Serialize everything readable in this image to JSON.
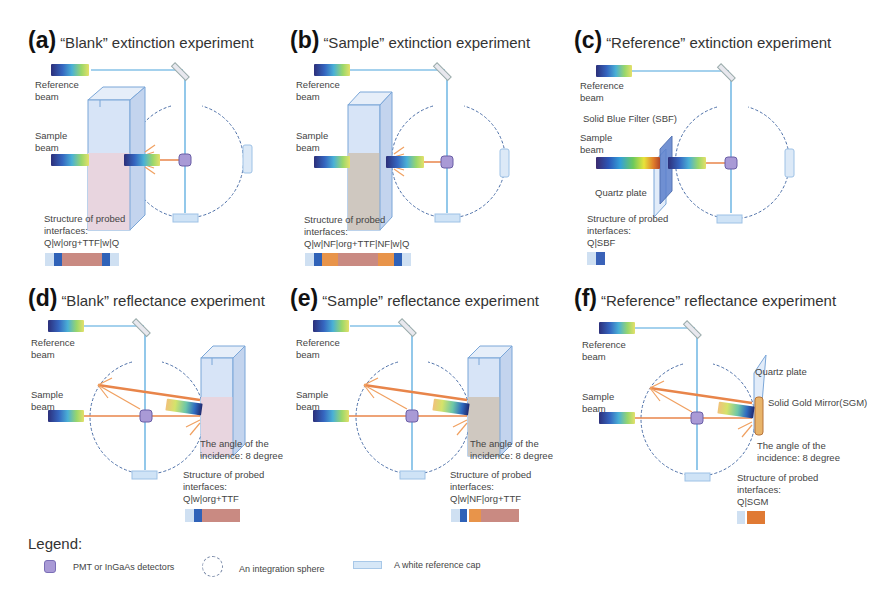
{
  "colors": {
    "beam_line": "#4aa3dc",
    "orange_ray": "#f0a060",
    "detector": "#a99ad6",
    "sphere_dash": "#4c6fa8",
    "cap": "#cfe3f6",
    "quartz": "#c8dcf2",
    "water_blue": "#2f62b8",
    "org_ttf": "#c98a82",
    "nf": "#e8944a",
    "sbf": "#4a6fc4",
    "sgm": "#e07a34"
  },
  "panels": [
    {
      "id": "a",
      "label": "(a)",
      "title": "“Blank” extinction experiment",
      "reference_beam_label": [
        "Reference",
        "beam"
      ],
      "sample_beam_label": [
        "Sample",
        "beam"
      ],
      "structure_label": [
        "Structure of probed",
        "interfaces:"
      ],
      "structure_formula": "Q|w|org+TTF|w|Q",
      "structure_layers": [
        "Q",
        "w",
        "org+TTF",
        "w",
        "Q"
      ]
    },
    {
      "id": "b",
      "label": "(b)",
      "title": "“Sample” extinction experiment",
      "reference_beam_label": [
        "Reference",
        "beam"
      ],
      "sample_beam_label": [
        "Sample",
        "beam"
      ],
      "structure_label": [
        "Structure of probed",
        "interfaces:"
      ],
      "structure_formula": "Q|w|NF|org+TTF|NF|w|Q",
      "structure_layers": [
        "Q",
        "w",
        "NF",
        "org+TTF",
        "NF",
        "w",
        "Q"
      ]
    },
    {
      "id": "c",
      "label": "(c)",
      "title": "“Reference” extinction experiment",
      "reference_beam_label": [
        "Reference",
        "beam"
      ],
      "sample_beam_label": [
        "Sample",
        "beam"
      ],
      "filter_label": "Solid Blue Filter (SBF)",
      "quartz_label": "Quartz plate",
      "structure_label": [
        "Structure of probed",
        "interfaces:"
      ],
      "structure_formula": "Q|SBF",
      "structure_layers": [
        "Q",
        "SBF"
      ]
    },
    {
      "id": "d",
      "label": "(d)",
      "title": "“Blank” reflectance experiment",
      "reference_beam_label": [
        "Reference",
        "beam"
      ],
      "sample_beam_label": [
        "Sample",
        "beam"
      ],
      "angle_label": [
        "The angle of the",
        "incidence: 8 degree"
      ],
      "structure_label": [
        "Structure of probed",
        "interfaces:"
      ],
      "structure_formula": "Q|w|org+TTF",
      "structure_layers": [
        "Q",
        "w",
        "org+TTF"
      ]
    },
    {
      "id": "e",
      "label": "(e)",
      "title": "“Sample” reflectance experiment",
      "reference_beam_label": [
        "Reference",
        "beam"
      ],
      "sample_beam_label": [
        "Sample",
        "beam"
      ],
      "angle_label": [
        "The angle of the",
        "incidence: 8 degree"
      ],
      "structure_label": [
        "Structure of probed",
        "interfaces:"
      ],
      "structure_formula": "Q|w|NF|org+TTF",
      "structure_layers": [
        "Q",
        "w",
        "NF",
        "org+TTF"
      ]
    },
    {
      "id": "f",
      "label": "(f)",
      "title": "“Reference” reflectance experiment",
      "reference_beam_label": [
        "Reference",
        "beam"
      ],
      "sample_beam_label": [
        "Sample",
        "beam"
      ],
      "quartz_label": "Quartz plate",
      "mirror_label": "Solid Gold Mirror(SGM)",
      "angle_label": [
        "The angle of the",
        "incidence: 8 degree"
      ],
      "structure_label": [
        "Structure of probed",
        "interfaces:"
      ],
      "structure_formula": "Q|SGM",
      "structure_layers": [
        "Q",
        "SGM"
      ]
    }
  ],
  "legend": {
    "title": "Legend:",
    "items": [
      {
        "icon": "detector-icon",
        "label": "PMT or InGaAs detectors"
      },
      {
        "icon": "integration-sphere-icon",
        "label": "An integration sphere"
      },
      {
        "icon": "white-reference-cap-icon",
        "label": "A white reference cap"
      }
    ]
  }
}
